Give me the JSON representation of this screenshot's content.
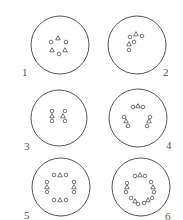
{
  "figure": {
    "stroke_color": "#555555",
    "panels": [
      {
        "label": "1",
        "cx": 60,
        "cy": 45,
        "r": 29,
        "label_pos": [
          22,
          67
        ],
        "markers": [
          {
            "shape": "circle",
            "x": 51,
            "y": 42
          },
          {
            "shape": "triangle",
            "x": 58,
            "y": 38
          },
          {
            "shape": "circle",
            "x": 66,
            "y": 42
          },
          {
            "shape": "triangle",
            "x": 52,
            "y": 50
          },
          {
            "shape": "circle",
            "x": 59,
            "y": 54
          },
          {
            "shape": "triangle",
            "x": 65,
            "y": 50
          }
        ]
      },
      {
        "label": "2",
        "cx": 137,
        "cy": 45,
        "r": 29,
        "label_pos": [
          163,
          67
        ],
        "markers": [
          {
            "shape": "circle",
            "x": 130,
            "y": 37
          },
          {
            "shape": "triangle",
            "x": 136,
            "y": 34
          },
          {
            "shape": "circle",
            "x": 142,
            "y": 36
          },
          {
            "shape": "circle",
            "x": 134,
            "y": 42
          },
          {
            "shape": "triangle",
            "x": 129,
            "y": 44
          },
          {
            "shape": "circle",
            "x": 129,
            "y": 50
          }
        ]
      },
      {
        "label": "3",
        "cx": 59,
        "cy": 118,
        "r": 28,
        "label_pos": [
          24,
          141
        ],
        "markers": [
          {
            "shape": "circle",
            "x": 52,
            "y": 111
          },
          {
            "shape": "triangle",
            "x": 52,
            "y": 116
          },
          {
            "shape": "circle",
            "x": 52,
            "y": 121
          },
          {
            "shape": "circle",
            "x": 65,
            "y": 111
          },
          {
            "shape": "triangle",
            "x": 63,
            "y": 116
          },
          {
            "shape": "circle",
            "x": 65,
            "y": 121
          }
        ]
      },
      {
        "label": "4",
        "cx": 138,
        "cy": 118,
        "r": 29,
        "label_pos": [
          166,
          140
        ],
        "markers": [
          {
            "shape": "circle",
            "x": 133,
            "y": 107
          },
          {
            "shape": "triangle",
            "x": 138,
            "y": 106
          },
          {
            "shape": "circle",
            "x": 143,
            "y": 107
          },
          {
            "shape": "circle",
            "x": 124,
            "y": 117
          },
          {
            "shape": "triangle",
            "x": 126,
            "y": 121
          },
          {
            "shape": "circle",
            "x": 128,
            "y": 126
          },
          {
            "shape": "circle",
            "x": 150,
            "y": 117
          },
          {
            "shape": "triangle",
            "x": 149,
            "y": 121
          },
          {
            "shape": "circle",
            "x": 147,
            "y": 126
          }
        ]
      },
      {
        "label": "5",
        "cx": 61,
        "cy": 187,
        "r": 29,
        "label_pos": [
          24,
          210
        ],
        "markers": [
          {
            "shape": "circle",
            "x": 54,
            "y": 175
          },
          {
            "shape": "triangle",
            "x": 60,
            "y": 175
          },
          {
            "shape": "circle",
            "x": 66,
            "y": 175
          },
          {
            "shape": "circle",
            "x": 47,
            "y": 182
          },
          {
            "shape": "triangle",
            "x": 47,
            "y": 187
          },
          {
            "shape": "circle",
            "x": 47,
            "y": 192
          },
          {
            "shape": "circle",
            "x": 74,
            "y": 182
          },
          {
            "shape": "triangle",
            "x": 74,
            "y": 187
          },
          {
            "shape": "circle",
            "x": 74,
            "y": 192
          },
          {
            "shape": "circle",
            "x": 54,
            "y": 200
          },
          {
            "shape": "triangle",
            "x": 60,
            "y": 200
          },
          {
            "shape": "circle",
            "x": 66,
            "y": 200
          }
        ]
      },
      {
        "label": "6",
        "cx": 141,
        "cy": 187,
        "r": 29,
        "label_pos": [
          165,
          211
        ],
        "markers": [
          {
            "shape": "circle",
            "x": 135,
            "y": 176
          },
          {
            "shape": "triangle",
            "x": 140,
            "y": 175
          },
          {
            "shape": "circle",
            "x": 145,
            "y": 176
          },
          {
            "shape": "circle",
            "x": 127,
            "y": 183
          },
          {
            "shape": "triangle",
            "x": 127,
            "y": 187
          },
          {
            "shape": "circle",
            "x": 126,
            "y": 192
          },
          {
            "shape": "circle",
            "x": 151,
            "y": 182
          },
          {
            "shape": "triangle",
            "x": 153,
            "y": 187
          },
          {
            "shape": "circle",
            "x": 154,
            "y": 192
          },
          {
            "shape": "circle",
            "x": 131,
            "y": 198
          },
          {
            "shape": "triangle",
            "x": 135,
            "y": 201
          },
          {
            "shape": "circle",
            "x": 138,
            "y": 204
          },
          {
            "shape": "circle",
            "x": 144,
            "y": 203
          },
          {
            "shape": "triangle",
            "x": 148,
            "y": 200
          },
          {
            "shape": "circle",
            "x": 152,
            "y": 198
          }
        ]
      }
    ]
  }
}
